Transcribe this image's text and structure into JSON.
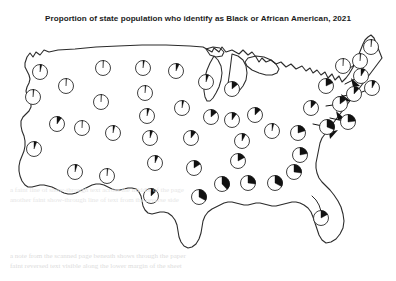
{
  "chart_title": "Proportion of state population who identify as Black or African American, 2021",
  "bleed_text": {
    "line1": "a note from the scanned page beneath shows through the paper",
    "line2": "faint reversed text visible along the lower margin of the sheet",
    "line3": "a faint line of show-through text across the middle of the page",
    "line4": "another faint show-through line of text from the reverse side"
  },
  "colors": {
    "ink": "#1c1c1c",
    "outline": "#2b2b2b",
    "pie_fill": "#111111",
    "pie_empty": "#ffffff",
    "background": "#ffffff",
    "bleed": "#dcdcdc"
  },
  "chart_data": {
    "type": "pie",
    "title": "Proportion of state population who identify as Black or African American, 2021",
    "subtitle": "",
    "xlabel": "",
    "ylabel": "",
    "units": "percent",
    "legend": [],
    "grid": false,
    "categories": [
      "Washington",
      "Oregon",
      "California",
      "Nevada",
      "Idaho",
      "Montana",
      "Wyoming",
      "Utah",
      "Arizona",
      "Colorado",
      "New Mexico",
      "North Dakota",
      "South Dakota",
      "Nebraska",
      "Kansas",
      "Oklahoma",
      "Texas",
      "Minnesota",
      "Iowa",
      "Missouri",
      "Arkansas",
      "Louisiana",
      "Wisconsin",
      "Illinois",
      "Michigan",
      "Indiana",
      "Ohio",
      "Kentucky",
      "Tennessee",
      "Mississippi",
      "Alabama",
      "Georgia",
      "Florida",
      "South Carolina",
      "North Carolina",
      "Virginia",
      "West Virginia",
      "Maryland",
      "Delaware",
      "Pennsylvania",
      "New Jersey",
      "New York",
      "Connecticut",
      "Rhode Island",
      "Massachusetts",
      "Vermont",
      "New Hampshire",
      "Maine"
    ],
    "values": [
      4,
      2,
      6,
      10,
      1,
      1,
      1,
      1,
      5,
      4,
      2,
      3,
      2,
      5,
      6,
      7,
      13,
      7,
      4,
      11,
      16,
      33,
      6,
      14,
      14,
      10,
      13,
      8,
      17,
      38,
      27,
      33,
      17,
      27,
      22,
      20,
      4,
      31,
      23,
      12,
      15,
      18,
      12,
      8,
      9,
      1,
      2,
      2
    ],
    "value_labels": [
      "4%",
      "2%",
      "6%",
      "10%",
      "1%",
      "1%",
      "1%",
      "1%",
      "5%",
      "4%",
      "2%",
      "3%",
      "2%",
      "5%",
      "6%",
      "7%",
      "13%",
      "7%",
      "4%",
      "11%",
      "16%",
      "33%",
      "6%",
      "14%",
      "14%",
      "10%",
      "13%",
      "8%",
      "17%",
      "38%",
      "27%",
      "33%",
      "17%",
      "27%",
      "22%",
      "20%",
      "4%",
      "31%",
      "23%",
      "12%",
      "15%",
      "18%",
      "12%",
      "8%",
      "9%",
      "1%",
      "2%",
      "2%"
    ],
    "markers": [
      {
        "state": "Washington",
        "abbr": "WA",
        "x": 40,
        "y": 72,
        "r": 7.5,
        "pct": 4,
        "leader": false
      },
      {
        "state": "Oregon",
        "abbr": "OR",
        "x": 33,
        "y": 97,
        "r": 7.5,
        "pct": 2,
        "leader": false
      },
      {
        "state": "California",
        "abbr": "CA",
        "x": 34,
        "y": 149,
        "r": 7.5,
        "pct": 6,
        "leader": false
      },
      {
        "state": "Nevada",
        "abbr": "NV",
        "x": 57,
        "y": 124,
        "r": 7.5,
        "pct": 10,
        "leader": false
      },
      {
        "state": "Idaho",
        "abbr": "ID",
        "x": 66,
        "y": 86,
        "r": 7.5,
        "pct": 1,
        "leader": false
      },
      {
        "state": "Montana",
        "abbr": "MT",
        "x": 103,
        "y": 68,
        "r": 7.5,
        "pct": 1,
        "leader": false
      },
      {
        "state": "Wyoming",
        "abbr": "WY",
        "x": 101,
        "y": 102,
        "r": 7.5,
        "pct": 1,
        "leader": false
      },
      {
        "state": "Utah",
        "abbr": "UT",
        "x": 82,
        "y": 128,
        "r": 7.5,
        "pct": 1,
        "leader": false
      },
      {
        "state": "Arizona",
        "abbr": "AZ",
        "x": 75,
        "y": 172,
        "r": 7.5,
        "pct": 5,
        "leader": false
      },
      {
        "state": "Colorado",
        "abbr": "CO",
        "x": 113,
        "y": 133,
        "r": 7.5,
        "pct": 4,
        "leader": false
      },
      {
        "state": "New Mexico",
        "abbr": "NM",
        "x": 107,
        "y": 176,
        "r": 7.5,
        "pct": 2,
        "leader": false
      },
      {
        "state": "North Dakota",
        "abbr": "ND",
        "x": 143,
        "y": 68,
        "r": 7.5,
        "pct": 3,
        "leader": false
      },
      {
        "state": "South Dakota",
        "abbr": "SD",
        "x": 145,
        "y": 93,
        "r": 7.5,
        "pct": 2,
        "leader": false
      },
      {
        "state": "Nebraska",
        "abbr": "NE",
        "x": 147,
        "y": 116,
        "r": 7.5,
        "pct": 5,
        "leader": false
      },
      {
        "state": "Kansas",
        "abbr": "KS",
        "x": 150,
        "y": 138,
        "r": 7.5,
        "pct": 6,
        "leader": false
      },
      {
        "state": "Oklahoma",
        "abbr": "OK",
        "x": 155,
        "y": 163,
        "r": 7.5,
        "pct": 7,
        "leader": false
      },
      {
        "state": "Texas",
        "abbr": "TX",
        "x": 151,
        "y": 196,
        "r": 7.5,
        "pct": 13,
        "leader": false
      },
      {
        "state": "Minnesota",
        "abbr": "MN",
        "x": 176,
        "y": 71,
        "r": 7.5,
        "pct": 7,
        "leader": false
      },
      {
        "state": "Iowa",
        "abbr": "IA",
        "x": 182,
        "y": 108,
        "r": 7.5,
        "pct": 4,
        "leader": false
      },
      {
        "state": "Missouri",
        "abbr": "MO",
        "x": 191,
        "y": 138,
        "r": 7.5,
        "pct": 11,
        "leader": false
      },
      {
        "state": "Arkansas",
        "abbr": "AR",
        "x": 194,
        "y": 168,
        "r": 7.5,
        "pct": 16,
        "leader": false
      },
      {
        "state": "Louisiana",
        "abbr": "LA",
        "x": 199,
        "y": 197,
        "r": 7.5,
        "pct": 33,
        "leader": false
      },
      {
        "state": "Wisconsin",
        "abbr": "WI",
        "x": 206,
        "y": 82,
        "r": 7.5,
        "pct": 6,
        "leader": false
      },
      {
        "state": "Illinois",
        "abbr": "IL",
        "x": 211,
        "y": 117,
        "r": 7.5,
        "pct": 14,
        "leader": false
      },
      {
        "state": "Michigan",
        "abbr": "MI",
        "x": 232,
        "y": 89,
        "r": 7.5,
        "pct": 14,
        "leader": false
      },
      {
        "state": "Indiana",
        "abbr": "IN",
        "x": 232,
        "y": 120,
        "r": 7.5,
        "pct": 10,
        "leader": false
      },
      {
        "state": "Ohio",
        "abbr": "OH",
        "x": 255,
        "y": 115,
        "r": 7.5,
        "pct": 13,
        "leader": false
      },
      {
        "state": "Kentucky",
        "abbr": "KY",
        "x": 242,
        "y": 141,
        "r": 7.5,
        "pct": 8,
        "leader": false
      },
      {
        "state": "Tennessee",
        "abbr": "TN",
        "x": 238,
        "y": 161,
        "r": 7.5,
        "pct": 17,
        "leader": false
      },
      {
        "state": "Mississippi",
        "abbr": "MS",
        "x": 222,
        "y": 184,
        "r": 7.5,
        "pct": 38,
        "leader": false
      },
      {
        "state": "Alabama",
        "abbr": "AL",
        "x": 248,
        "y": 183,
        "r": 7.5,
        "pct": 27,
        "leader": false
      },
      {
        "state": "Georgia",
        "abbr": "GA",
        "x": 275,
        "y": 183,
        "r": 7.5,
        "pct": 33,
        "leader": false
      },
      {
        "state": "Florida",
        "abbr": "FL",
        "x": 321,
        "y": 218,
        "r": 7.5,
        "pct": 17,
        "leader": false
      },
      {
        "state": "South Carolina",
        "abbr": "SC",
        "x": 294,
        "y": 172,
        "r": 7.5,
        "pct": 27,
        "leader": false
      },
      {
        "state": "North Carolina",
        "abbr": "NC",
        "x": 300,
        "y": 155,
        "r": 7.5,
        "pct": 22,
        "leader": false
      },
      {
        "state": "Virginia",
        "abbr": "VA",
        "x": 298,
        "y": 133,
        "r": 7.5,
        "pct": 20,
        "leader": false
      },
      {
        "state": "West Virginia",
        "abbr": "WV",
        "x": 272,
        "y": 131,
        "r": 7.5,
        "pct": 4,
        "leader": false
      },
      {
        "state": "Maryland",
        "abbr": "MD",
        "x": 327,
        "y": 127,
        "r": 7.5,
        "pct": 31,
        "leader": true,
        "lx": 313,
        "ly": 124
      },
      {
        "state": "Delaware",
        "abbr": "DE",
        "x": 348,
        "y": 122,
        "r": 7.5,
        "pct": 23,
        "leader": true,
        "lx": 330,
        "ly": 118
      },
      {
        "state": "Pennsylvania",
        "abbr": "PA",
        "x": 311,
        "y": 108,
        "r": 7.5,
        "pct": 12,
        "leader": false
      },
      {
        "state": "New Jersey",
        "abbr": "NJ",
        "x": 340,
        "y": 104,
        "r": 7.5,
        "pct": 15,
        "leader": true,
        "lx": 326,
        "ly": 106
      },
      {
        "state": "New York",
        "abbr": "NY",
        "x": 326,
        "y": 86,
        "r": 7.5,
        "pct": 18,
        "leader": false
      },
      {
        "state": "Connecticut",
        "abbr": "CT",
        "x": 354,
        "y": 94,
        "r": 7.5,
        "pct": 12,
        "leader": true,
        "lx": 338,
        "ly": 97
      },
      {
        "state": "Rhode Island",
        "abbr": "RI",
        "x": 372,
        "y": 88,
        "r": 7.5,
        "pct": 8,
        "leader": true,
        "lx": 352,
        "ly": 96
      },
      {
        "state": "Massachusetts",
        "abbr": "MA",
        "x": 361,
        "y": 76,
        "r": 7.5,
        "pct": 9,
        "leader": true,
        "lx": 345,
        "ly": 84
      },
      {
        "state": "Vermont",
        "abbr": "VT",
        "x": 343,
        "y": 66,
        "r": 7.5,
        "pct": 1,
        "leader": false
      },
      {
        "state": "New Hampshire",
        "abbr": "NH",
        "x": 360,
        "y": 61,
        "r": 7.5,
        "pct": 2,
        "leader": true,
        "lx": 350,
        "ly": 68
      },
      {
        "state": "Maine",
        "abbr": "ME",
        "x": 371,
        "y": 47,
        "r": 7.5,
        "pct": 2,
        "leader": false
      }
    ]
  }
}
